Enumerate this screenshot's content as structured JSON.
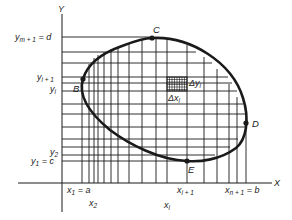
{
  "figure": {
    "colors": {
      "ink": "#1a1a1a",
      "background": "#ffffff"
    },
    "axes": {
      "x_label": "X",
      "y_label": "Y"
    },
    "x_ticks": [
      {
        "main": "x",
        "sub": "1",
        "suffix": " = a"
      },
      {
        "main": "x",
        "sub": "2",
        "suffix": ""
      },
      {
        "main": "x",
        "sub": "i",
        "suffix": ""
      },
      {
        "main": "x",
        "sub": "i + 1",
        "suffix": ""
      },
      {
        "main": "x",
        "sub": "n + 1",
        "suffix": " = b"
      }
    ],
    "y_ticks": [
      {
        "main": "y",
        "sub": "m + 1",
        "suffix": " = d"
      },
      {
        "main": "y",
        "sub": "i + 1",
        "suffix": ""
      },
      {
        "main": "y",
        "sub": "i",
        "suffix": ""
      },
      {
        "main": "y",
        "sub": "2",
        "suffix": ""
      },
      {
        "main": "y",
        "sub": "1",
        "suffix": " = c"
      }
    ],
    "points": [
      {
        "label": "B"
      },
      {
        "label": "C"
      },
      {
        "label": "D"
      },
      {
        "label": "E"
      }
    ],
    "cell_labels": {
      "dy": {
        "main": "Δy",
        "sub": "i"
      },
      "dx": {
        "main": "Δx",
        "sub": "i"
      }
    }
  }
}
